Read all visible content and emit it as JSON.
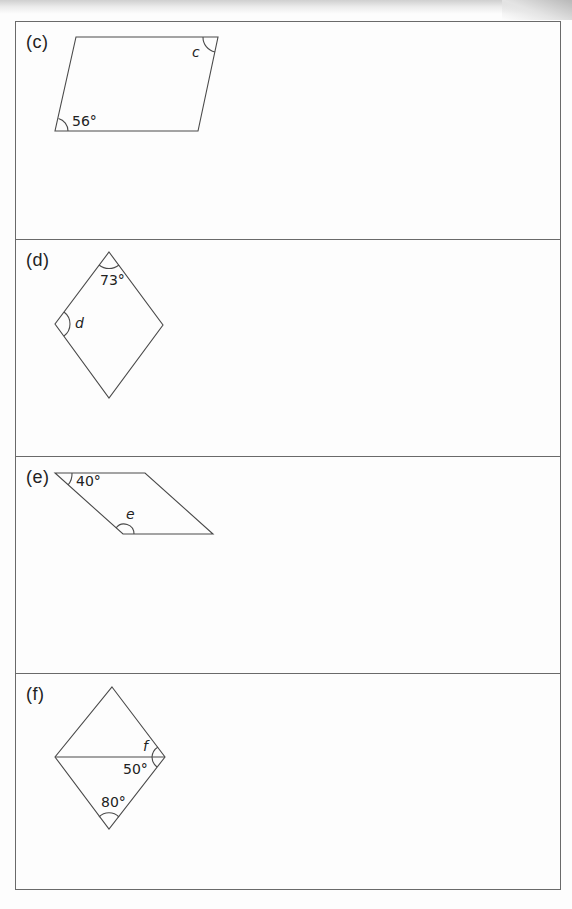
{
  "worksheet": {
    "panels": [
      {
        "label": "(c)",
        "shape": "parallelogram",
        "given_angle": "56°",
        "unknown": "c"
      },
      {
        "label": "(d)",
        "shape": "rhombus",
        "given_angle": "73°",
        "unknown": "d"
      },
      {
        "label": "(e)",
        "shape": "parallelogram",
        "given_angle": "40°",
        "unknown": "e"
      },
      {
        "label": "(f)",
        "shape": "rhombus-with-diagonal",
        "given_angles": [
          "50°",
          "80°"
        ],
        "unknown": "f"
      }
    ]
  },
  "colors": {
    "line": "#4a4a4a",
    "border": "#6a6a6a",
    "text": "#222222",
    "paper": "#fdfdfd"
  }
}
